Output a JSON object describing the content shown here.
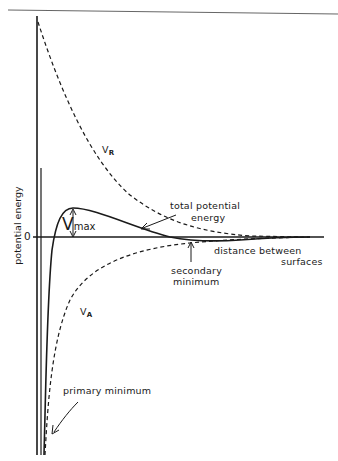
{
  "figure": {
    "type": "DLVO potential energy diagram",
    "y_axis_label": "potential energy",
    "zero_label": "0",
    "x_axis_label_line1": "distance between",
    "x_axis_label_line2": "surfaces",
    "curves": {
      "repulsive": {
        "label_main": "V",
        "label_sub": "R",
        "style": "dashed"
      },
      "attractive": {
        "label_main": "V",
        "label_sub": "A",
        "style": "dashed"
      },
      "total": {
        "label_line1": "total potential",
        "label_line2": "energy",
        "style": "solid"
      }
    },
    "annotations": {
      "vmax_main": "V",
      "vmax_sub": "max",
      "secondary_minimum_line1": "secondary",
      "secondary_minimum_line2": "minimum",
      "primary_minimum": "primary minimum"
    },
    "colors": {
      "ink": "#1a1a1a",
      "background": "#ffffff",
      "rule": "#555555"
    }
  }
}
